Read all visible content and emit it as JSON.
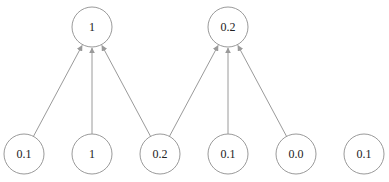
{
  "diagram": {
    "type": "graph",
    "top_nodes": [
      {
        "id": "t0",
        "label": "1",
        "cx": 92,
        "cy": 27
      },
      {
        "id": "t1",
        "label": "0.2",
        "cx": 228,
        "cy": 27
      }
    ],
    "bottom_nodes": [
      {
        "id": "b0",
        "label": "0.1",
        "cx": 24,
        "cy": 154
      },
      {
        "id": "b1",
        "label": "1",
        "cx": 92,
        "cy": 154
      },
      {
        "id": "b2",
        "label": "0.2",
        "cx": 160,
        "cy": 154
      },
      {
        "id": "b3",
        "label": "0.1",
        "cx": 228,
        "cy": 154
      },
      {
        "id": "b4",
        "label": "0.0",
        "cx": 296,
        "cy": 154
      },
      {
        "id": "b5",
        "label": "0.1",
        "cx": 364,
        "cy": 154
      }
    ],
    "edges": [
      {
        "from": "b0",
        "to": "t0"
      },
      {
        "from": "b1",
        "to": "t0"
      },
      {
        "from": "b2",
        "to": "t0"
      },
      {
        "from": "b2",
        "to": "t1"
      },
      {
        "from": "b3",
        "to": "t1"
      },
      {
        "from": "b4",
        "to": "t1"
      }
    ],
    "node_radius": 20,
    "colors": {
      "stroke": "#9a9a9a",
      "text": "#222222",
      "background": "#ffffff"
    }
  }
}
